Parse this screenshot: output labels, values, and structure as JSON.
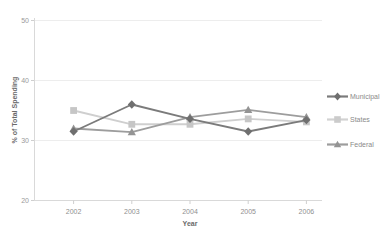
{
  "chart_data": {
    "type": "line",
    "title": "",
    "xlabel": "Year",
    "ylabel": "% of Total Spending",
    "x": [
      "2002",
      "2003",
      "2004",
      "2005",
      "2006"
    ],
    "categories": [
      "2002",
      "2003",
      "2004",
      "2005",
      "2006"
    ],
    "ylim": [
      20,
      50
    ],
    "yticks": [
      "20",
      "30",
      "40",
      "50"
    ],
    "ytick_values": [
      20,
      30,
      40,
      50
    ],
    "grid": true,
    "legend_position": "right",
    "series": [
      {
        "name": "Municipal",
        "color": "#7b7b7b",
        "marker": "diamond",
        "values": [
          31.5,
          36.0,
          33.6,
          31.5,
          33.4
        ]
      },
      {
        "name": "States",
        "color": "#cfcfcf",
        "marker": "square",
        "values": [
          35.0,
          32.7,
          32.7,
          33.6,
          33.1
        ]
      },
      {
        "name": "Federal",
        "color": "#9d9d9d",
        "marker": "triangle",
        "values": [
          32.0,
          31.4,
          33.9,
          35.1,
          33.9
        ]
      }
    ]
  },
  "axes": {
    "y_title": "% of Total Spending",
    "x_title": "Year"
  },
  "legend": {
    "items": [
      {
        "label": "Municipal",
        "color": "#7b7b7b"
      },
      {
        "label": "States",
        "color": "#cfcfcf"
      },
      {
        "label": "Federal",
        "color": "#9d9d9d"
      }
    ]
  }
}
